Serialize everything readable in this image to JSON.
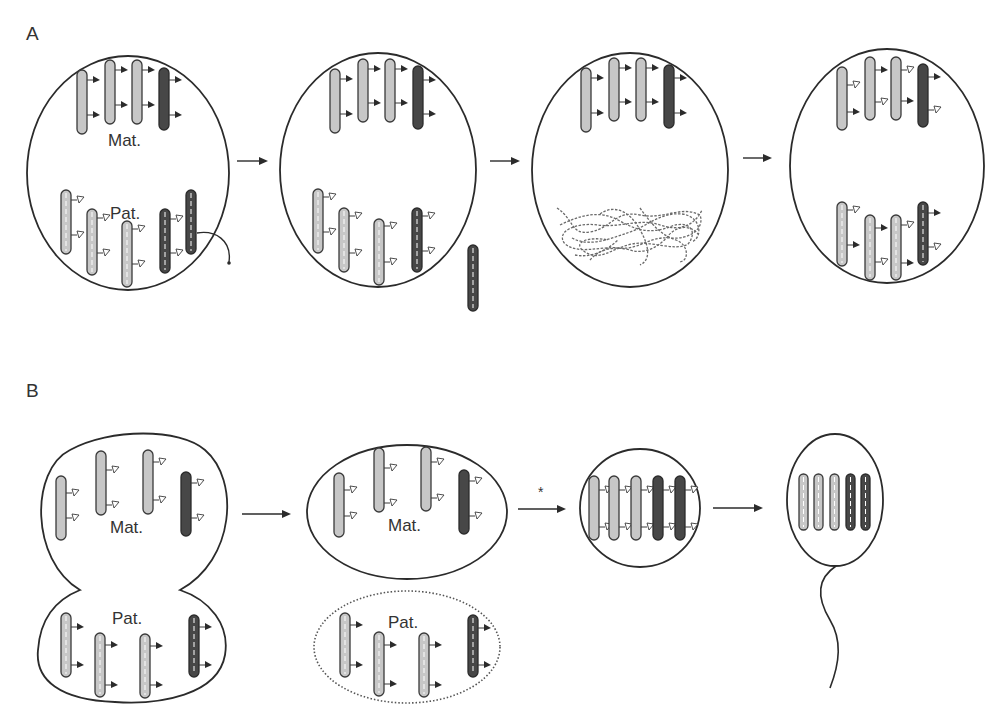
{
  "figure": {
    "panels": [
      {
        "id": "A",
        "label": "A",
        "description": "Paternal chromosome loss/decondensation sequence",
        "cells": [
          {
            "id": "A1",
            "maternal_label": "Mat.",
            "paternal_label": "Pat."
          },
          {
            "id": "A2"
          },
          {
            "id": "A3"
          },
          {
            "id": "A4"
          }
        ],
        "arrows": 3
      },
      {
        "id": "B",
        "label": "B",
        "description": "Asymmetric division separating paternal set, then sperm formation",
        "cells": [
          {
            "id": "B1",
            "maternal_label": "Mat.",
            "paternal_label": "Pat."
          },
          {
            "id": "B2",
            "maternal_label": "Mat.",
            "paternal_label": "Pat.",
            "paternal_outline": "dotted"
          },
          {
            "id": "B3",
            "arrow_annotation": "*"
          },
          {
            "id": "B4",
            "shape": "sperm"
          }
        ],
        "arrows": 3
      }
    ],
    "legend_semantics": {
      "solid_chromosome": "maternal",
      "dashed_chromosome": "paternal",
      "filled_flag": "active mark",
      "open_flag": "inactive mark",
      "light_fill": "#c7c7c7",
      "dark_fill": "#474747"
    }
  }
}
